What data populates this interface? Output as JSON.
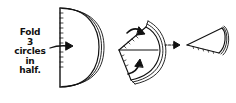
{
  "diagram": {
    "caption_lines": [
      "Fold",
      "3",
      "circles",
      "in",
      "half."
    ],
    "steps": [
      {
        "name": "half-circle",
        "description": "3 circles folded in half"
      },
      {
        "name": "folded-quarter",
        "description": "fold sides in toward center"
      },
      {
        "name": "cone",
        "description": "resulting cone shape"
      }
    ],
    "ink_color": "#111111",
    "background_color": "#ffffff"
  }
}
